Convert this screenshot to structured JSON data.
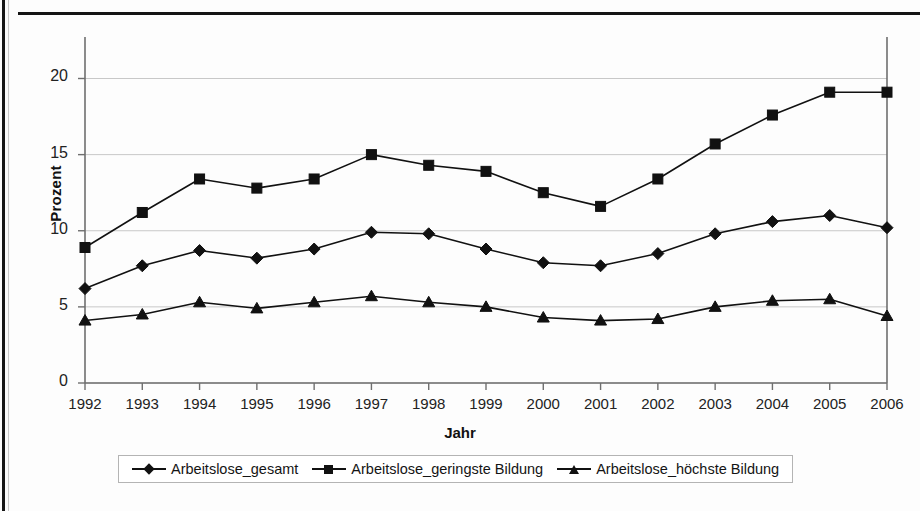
{
  "chart_data": {
    "type": "line",
    "title": "",
    "xlabel": "Jahr",
    "ylabel": "Prozent",
    "x": [
      1992,
      1993,
      1994,
      1995,
      1996,
      1997,
      1998,
      1999,
      2000,
      2001,
      2002,
      2003,
      2004,
      2005,
      2006
    ],
    "categories": [
      "1992",
      "1993",
      "1994",
      "1995",
      "1996",
      "1997",
      "1998",
      "1999",
      "2000",
      "2001",
      "2002",
      "2003",
      "2004",
      "2005",
      "2006"
    ],
    "xtick_labels": [
      "1992",
      "1993",
      "1994",
      "1995",
      "1996",
      "1997",
      "1998",
      "1999",
      "2000",
      "2001",
      "2002",
      "2003",
      "2004",
      "2005",
      "2006"
    ],
    "ytick_labels": [
      "0",
      "5",
      "10",
      "15",
      "20"
    ],
    "yticks": [
      0,
      5,
      10,
      15,
      20
    ],
    "ylim": [
      0,
      22.2
    ],
    "grid": "horizontal",
    "legend_position": "bottom",
    "series": [
      {
        "name": "Arbeitslose_gesamt",
        "marker": "diamond",
        "color": "#111111",
        "values": [
          6.2,
          7.7,
          8.7,
          8.2,
          8.8,
          9.9,
          9.8,
          8.8,
          7.9,
          7.7,
          8.5,
          9.8,
          10.6,
          11.0,
          10.2
        ]
      },
      {
        "name": "Arbeitslose_geringste Bildung",
        "marker": "square",
        "color": "#111111",
        "values": [
          8.9,
          11.2,
          13.4,
          12.8,
          13.4,
          15.0,
          14.3,
          13.9,
          12.5,
          11.6,
          13.4,
          15.7,
          17.6,
          19.1,
          19.1
        ]
      },
      {
        "name": "Arbeitslose_höchste Bildung",
        "marker": "triangle",
        "color": "#111111",
        "values": [
          4.1,
          4.5,
          5.3,
          4.9,
          5.3,
          5.7,
          5.3,
          5.0,
          4.3,
          4.1,
          4.2,
          5.0,
          5.4,
          5.5,
          4.4
        ]
      }
    ]
  },
  "axes": {
    "y_title": "Prozent",
    "x_title": "Jahr"
  },
  "legend": {
    "entries": [
      {
        "label": "Arbeitslose_gesamt",
        "marker": "diamond"
      },
      {
        "label": "Arbeitslose_geringste Bildung",
        "marker": "square"
      },
      {
        "label": "Arbeitslose_höchste Bildung",
        "marker": "triangle"
      }
    ]
  }
}
